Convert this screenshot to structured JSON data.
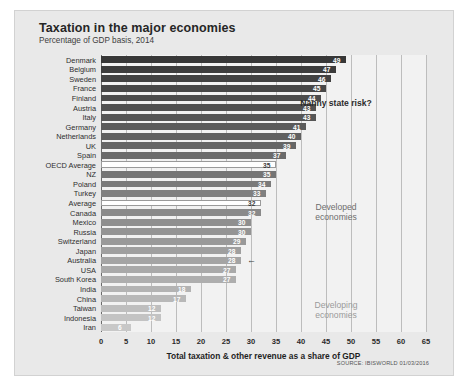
{
  "header": {
    "title": "Taxation in the major economies",
    "subtitle": "Percentage of GDP basis, 2014"
  },
  "annotations": {
    "nanny": "Nanny state risk?",
    "developed_line1": "Developed",
    "developed_line2": "economies",
    "developing_line1": "Developing",
    "developing_line2": "economies",
    "australia_marker": "←"
  },
  "source": "SOURCE: IBISWORLD 01/03/2016",
  "colors": {
    "panel": "#e9e9e9",
    "plot": "#f2f2f2",
    "grid": "#bdbdbd",
    "axis": "#6b6b6b",
    "bar_dark": "#3b3b3b",
    "bar_light": "#c8c8c8",
    "highlight": "#ffffff"
  },
  "chart_data": {
    "type": "bar",
    "orientation": "horizontal",
    "title": "Taxation in the major economies",
    "subtitle": "Percentage of GDP basis, 2014",
    "xlabel": "Total taxation & other revenue as a share of GDP",
    "ylabel": "",
    "xlim": [
      0,
      65
    ],
    "xticks": [
      0,
      5,
      10,
      15,
      20,
      25,
      30,
      35,
      40,
      45,
      50,
      55,
      60,
      65
    ],
    "grid": true,
    "legend": false,
    "categories": [
      "Denmark",
      "Belgium",
      "Sweden",
      "France",
      "Finland",
      "Austria",
      "Italy",
      "Germany",
      "Netherlands",
      "UK",
      "Spain",
      "OECD Average",
      "NZ",
      "Poland",
      "Turkey",
      "Average",
      "Canada",
      "Mexico",
      "Russia",
      "Switzerland",
      "Japan",
      "Australia",
      "USA",
      "South Korea",
      "India",
      "China",
      "Taiwan",
      "Indonesia",
      "Iran"
    ],
    "values": [
      49,
      47,
      46,
      45,
      44,
      43,
      43,
      41,
      40,
      39,
      37,
      35,
      35,
      34,
      33,
      32,
      32,
      30,
      30,
      29,
      28,
      28,
      27,
      27,
      18,
      17,
      12,
      12,
      6
    ],
    "highlighted": [
      "OECD Average",
      "Average"
    ],
    "marked": [
      "Australia"
    ]
  }
}
